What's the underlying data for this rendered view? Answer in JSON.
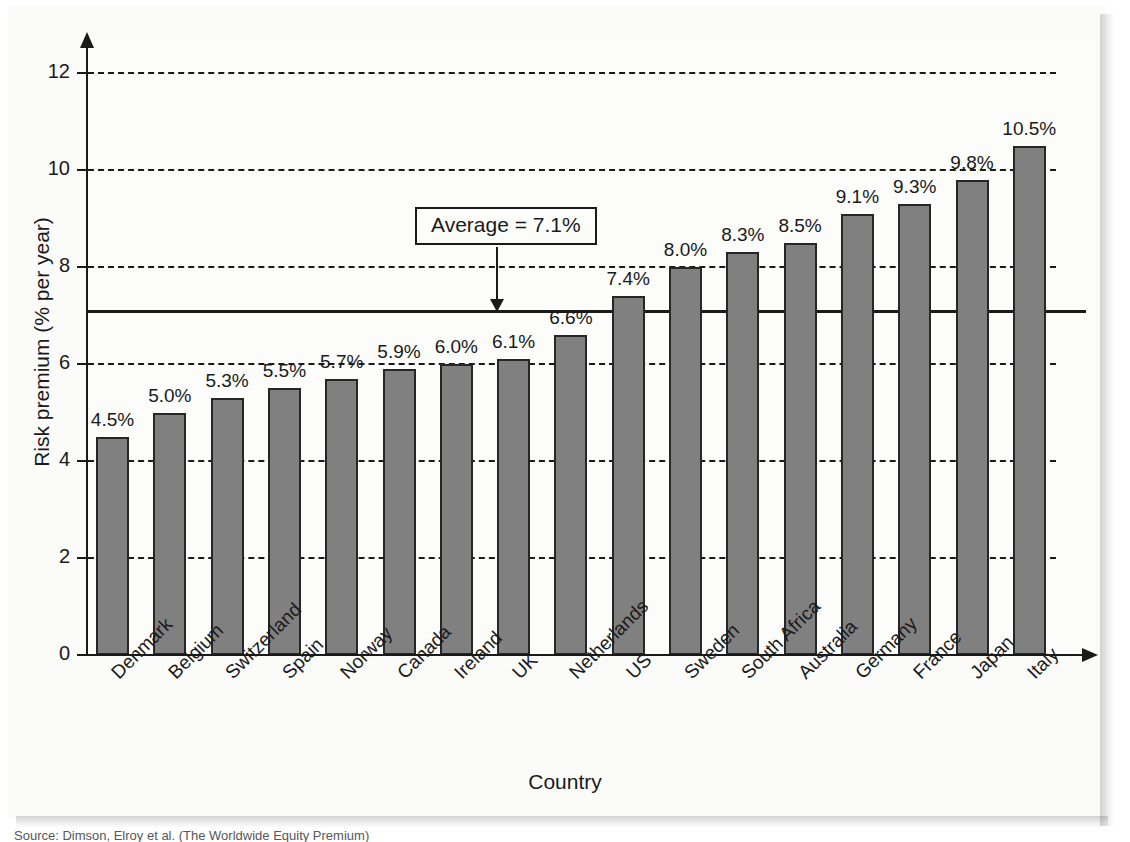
{
  "figure": {
    "source_caption": "Source: Dimson, Elroy et al. (The Worldwide Equity Premium)"
  },
  "chart_data": {
    "type": "bar",
    "title": "",
    "xlabel": "Country",
    "ylabel": "Risk premium (% per year)",
    "categories": [
      "Denmark",
      "Belgium",
      "Switzerland",
      "Spain",
      "Norway",
      "Canada",
      "Ireland",
      "UK",
      "Netherlands",
      "US",
      "Sweden",
      "South Africa",
      "Australia",
      "Germany",
      "France",
      "Japan",
      "Italy"
    ],
    "values": [
      4.5,
      5.0,
      5.3,
      5.5,
      5.7,
      5.9,
      6.0,
      6.1,
      6.6,
      7.4,
      8.0,
      8.3,
      8.5,
      9.1,
      9.3,
      9.8,
      10.5
    ],
    "value_labels": [
      "4.5%",
      "5.0%",
      "5.3%",
      "5.5%",
      "5.7%",
      "5.9%",
      "6.0%",
      "6.1%",
      "6.6%",
      "7.4%",
      "8.0%",
      "8.3%",
      "8.5%",
      "9.1%",
      "9.3%",
      "9.8%",
      "10.5%"
    ],
    "ylim": [
      0,
      13
    ],
    "yticks": [
      0,
      2,
      4,
      6,
      8,
      10,
      12
    ],
    "ytick_labels": [
      "0",
      "2",
      "4",
      "6",
      "8",
      "10",
      "12"
    ],
    "grid": "horizontal-dashed",
    "legend": "none",
    "bar_color": "#808080",
    "bar_edge_color": "#262626",
    "axis_color": "#1a1a1a",
    "annotations": [
      {
        "name": "average-reference",
        "label": "Average = 7.1%",
        "value": 7.1,
        "style": "solid-line-with-arrow"
      }
    ]
  }
}
